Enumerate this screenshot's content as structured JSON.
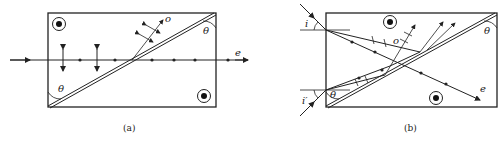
{
  "figure": {
    "panels": [
      {
        "id": "a",
        "caption": "(a)",
        "labels": {
          "theta_top": "θ",
          "theta_bottom": "θ",
          "ordinary": "o",
          "extraordinary": "e"
        },
        "optic_axis_symbol": "circled-dot",
        "description": "Polarizing prism: normally incident beam splits at cemented diagonal interface; o-ray reflected upward, e-ray transmitted straight through"
      },
      {
        "id": "b",
        "caption": "(b)",
        "labels": {
          "incidence_top": "i",
          "incidence_bottom": "i′",
          "theta_top": "θ",
          "theta_bottom": "θ",
          "ordinary": "o",
          "extraordinary": "e"
        },
        "optic_axis_symbol": "circled-dot",
        "description": "Oblique incidence at angles i and i′; o-rays totally reflected at diagonal, e-ray transmitted"
      }
    ]
  }
}
